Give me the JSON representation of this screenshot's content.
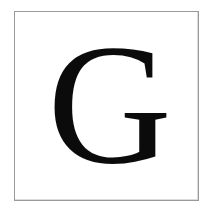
{
  "card": {
    "letter": "G",
    "letter_case": "uppercase",
    "glyph_style": "serif",
    "glyph_color": "#0b0b0b",
    "background_color": "#ffffff",
    "frame": {
      "border_color": "#9a9a9a",
      "border_width_px": 1,
      "x": 14,
      "y": 11,
      "width": 185,
      "height": 190
    },
    "glyph_metrics": {
      "font_size_px": 172,
      "cap_left_px": 56,
      "cap_right_px": 170,
      "cap_top_px": 45,
      "cap_bottom_px": 163
    }
  }
}
